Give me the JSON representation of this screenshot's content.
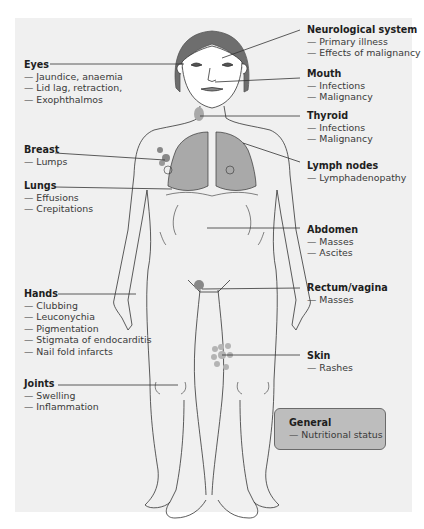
{
  "diagram": {
    "colors": {
      "background": "#f0f0f0",
      "hair": "#6e6e6e",
      "organ_fill": "#a9a9a9",
      "skin_spots": "#b4b4b4",
      "general_box": "#bdbdbd",
      "outline": "#333333"
    },
    "annotations_left": [
      {
        "title": "Eyes",
        "items": [
          "— Jaundice, anaemia",
          "— Lid lag, retraction,",
          "— Exophthalmos"
        ]
      },
      {
        "title": "Breast",
        "items": [
          "— Lumps"
        ]
      },
      {
        "title": "Lungs",
        "items": [
          "— Effusions",
          "— Crepitations"
        ]
      },
      {
        "title": "Hands",
        "items": [
          "— Clubbing",
          "— Leuconychia",
          "— Pigmentation",
          "— Stigmata of endocarditis",
          "— Nail fold infarcts"
        ]
      },
      {
        "title": "Joints",
        "items": [
          "— Swelling",
          "— Inflammation"
        ]
      }
    ],
    "annotations_right": [
      {
        "title": "Neurological system",
        "items": [
          "— Primary illness",
          "— Effects of malignancy"
        ]
      },
      {
        "title": "Mouth",
        "items": [
          "— Infections",
          "— Malignancy"
        ]
      },
      {
        "title": "Thyroid",
        "items": [
          "— Infections",
          "— Malignancy"
        ]
      },
      {
        "title": "Lymph nodes",
        "items": [
          "— Lymphadenopathy"
        ]
      },
      {
        "title": "Abdomen",
        "items": [
          "— Masses",
          "— Ascites"
        ]
      },
      {
        "title": "Rectum/vagina",
        "items": [
          "— Masses"
        ]
      },
      {
        "title": "Skin",
        "items": [
          "— Rashes"
        ]
      }
    ],
    "general_box": {
      "title": "General",
      "items": [
        "— Nutritional status"
      ]
    }
  }
}
